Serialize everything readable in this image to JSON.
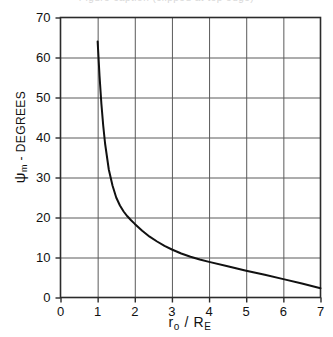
{
  "figure": {
    "title_clipped": "Figure caption (clipped at top edge)"
  },
  "axes": {
    "y_label_symbol": "ψ",
    "y_label_subscript": "m",
    "y_label_rest": " - DEGREES",
    "x_label_symbol": "r",
    "x_label_subscript_1": "o",
    "x_label_mid": " / R",
    "x_label_subscript_2": "E",
    "y_ticks": [
      "0",
      "10",
      "20",
      "30",
      "40",
      "50",
      "60",
      "70"
    ],
    "x_ticks": [
      "0",
      "1",
      "2",
      "3",
      "4",
      "5",
      "6",
      "7"
    ],
    "x_origin_label": "0"
  },
  "chart_data": {
    "type": "line",
    "title": "",
    "xlabel": "r_o / R_E",
    "ylabel": "psi_m - DEGREES",
    "xlim": [
      0,
      7
    ],
    "ylim": [
      0,
      70
    ],
    "xticks": [
      0,
      1,
      2,
      3,
      4,
      5,
      6,
      7
    ],
    "yticks": [
      0,
      10,
      20,
      30,
      40,
      50,
      60,
      70
    ],
    "grid": true,
    "legend": "none",
    "series": [
      {
        "name": "psi_m vs r_o/R_E",
        "x": [
          1.0,
          1.05,
          1.1,
          1.15,
          1.2,
          1.3,
          1.4,
          1.5,
          1.6,
          1.7,
          1.8,
          1.9,
          2.0,
          2.2,
          2.4,
          2.6,
          2.8,
          3.0,
          3.25,
          3.5,
          3.75,
          4.0,
          4.5,
          5.0,
          5.5,
          6.0,
          6.5,
          7.0
        ],
        "y": [
          64.0,
          55.5,
          48.5,
          43.0,
          38.5,
          32.0,
          28.0,
          25.0,
          23.0,
          21.5,
          20.3,
          19.3,
          18.4,
          16.7,
          15.2,
          14.0,
          12.9,
          12.0,
          11.0,
          10.2,
          9.5,
          8.9,
          7.8,
          6.7,
          5.7,
          4.6,
          3.5,
          2.3
        ]
      }
    ]
  }
}
